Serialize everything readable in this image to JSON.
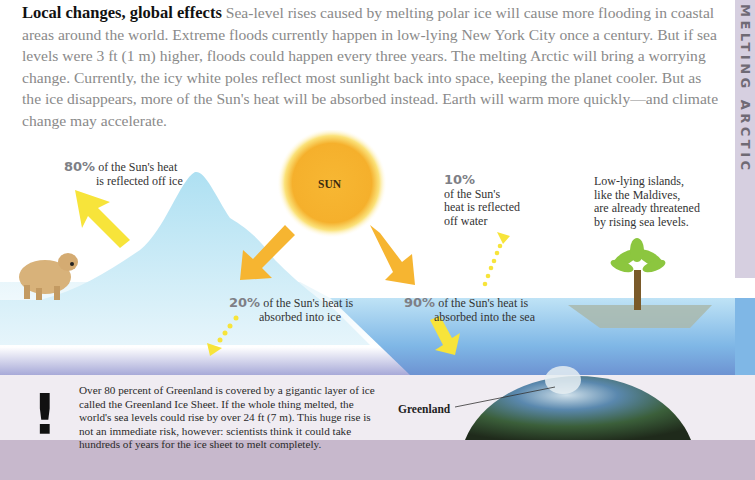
{
  "intro": {
    "heading": "Local changes, global effects",
    "body": "Sea-level rises caused by melting polar ice will cause more flooding in coastal areas around the world. Extreme floods currently happen in low-lying New York City once a century. But if sea levels were 3 ft (1 m) higher, floods could happen every three years. The melting Arctic will bring a worrying change. Currently, the icy white poles reflect most sunlight back into space, keeping the planet cooler. But as the ice disappears, more of the Sun's heat will be absorbed instead. Earth will warm more quickly—and climate change may accelerate."
  },
  "side_tab": {
    "label": "MELTING ARCTIC"
  },
  "diagram": {
    "sun_label": "SUN",
    "ice_reflect": {
      "pct": "80%",
      "line1": "of the Sun's heat",
      "line2": "is reflected off ice"
    },
    "ice_absorb": {
      "pct": "20%",
      "line1": "of the Sun's heat is",
      "line2": "absorbed into ice"
    },
    "water_reflect": {
      "pct": "10%",
      "line1": "of the Sun's",
      "line2": "heat is reflected",
      "line3": "off water"
    },
    "water_absorb": {
      "pct": "90%",
      "line1": "of the Sun's heat is",
      "line2": "absorbed into the sea"
    },
    "islands_note": {
      "line1": "Low-lying islands,",
      "line2": "like the Maldives,",
      "line3": "are already threatened",
      "line4": "by rising sea levels."
    }
  },
  "fact_box": {
    "icon": "exclamation-icon",
    "symbol": "!",
    "text": "Over 80 percent of Greenland is covered by a gigantic layer of ice called the Greenland Ice Sheet. If the whole thing melted, the world's sea levels could rise by over 24 ft (7 m). This huge rise is not an immediate risk, however: scientists think it could take hundreds of years for the ice sheet to melt completely.",
    "globe_label": "Greenland"
  },
  "colors": {
    "sun": "#f7b733",
    "arrow_orange": "#f6b531",
    "arrow_yellow": "#f7e43a",
    "ice": "#bfe4f3",
    "sea": "#8ec4ea",
    "side_tab": "#d6cfe0",
    "bottom_band": "#c7b8cc",
    "palm": "#8cc63f"
  }
}
